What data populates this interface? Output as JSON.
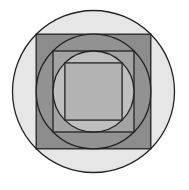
{
  "diagram": {
    "title": "",
    "background": "#ffffff",
    "stroke_color": "#222222",
    "stroke_width": 1.3,
    "center": {
      "x": 93.5,
      "y": 91.5
    },
    "shapes": [
      {
        "id": "outer-circle",
        "type": "circle",
        "r": 81,
        "fill": "#e6e6e6"
      },
      {
        "id": "outer-square",
        "type": "square",
        "half": 57.3,
        "fill": "#8c8c8c"
      },
      {
        "id": "middle-circle",
        "type": "circle",
        "r": 57.3,
        "fill": "#929292"
      },
      {
        "id": "middle-square",
        "type": "square",
        "half": 40.5,
        "fill": "#a3a3a3"
      },
      {
        "id": "inner-circle",
        "type": "circle",
        "r": 40.5,
        "fill": "#bfbfbf"
      },
      {
        "id": "inner-square",
        "type": "square",
        "half": 28.6,
        "fill": "#b3b3b3"
      }
    ]
  }
}
